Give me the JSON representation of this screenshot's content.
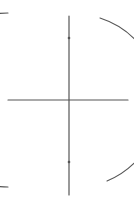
{
  "diagram": {
    "title": "",
    "type": "perpendicular-bisector-construction",
    "stroke_color": "#555555",
    "background": "#ffffff",
    "vertical_line": {
      "x1": 69,
      "y1": 16,
      "x2": 69,
      "y2": 195
    },
    "horizontal_line": {
      "x1": 8,
      "y1": 100,
      "x2": 128,
      "y2": 100
    },
    "left_arc": {
      "center": [
        130,
        100
      ],
      "radius": 87,
      "start": [
        8,
        13
      ],
      "end": [
        8,
        187
      ]
    },
    "right_arc": {
      "center": [
        8,
        100
      ],
      "radius": 87,
      "start": [
        100,
        18
      ],
      "end": [
        107,
        181
      ]
    },
    "intersections": [
      [
        69,
        38
      ],
      [
        69,
        162
      ]
    ],
    "labels": []
  }
}
